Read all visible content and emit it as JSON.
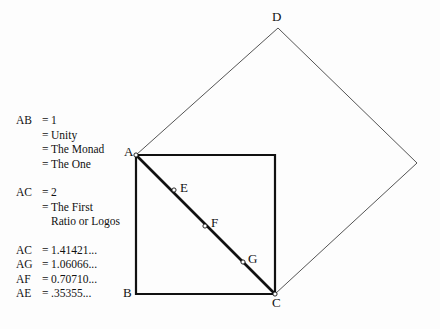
{
  "figure": {
    "background_color": "#fdfdfd",
    "line_color": "#111111",
    "thin_line_color": "#555555",
    "legend": [
      {
        "key": "AB",
        "rows": [
          {
            "eq": "=",
            "value": "1"
          },
          {
            "eq": "=",
            "value": "Unity"
          },
          {
            "eq": "=",
            "value": "The Monad"
          },
          {
            "eq": "=",
            "value": "The One"
          }
        ]
      },
      {
        "key": "AC",
        "rows": [
          {
            "eq": "=",
            "value": "2"
          },
          {
            "eq": "=",
            "value": "The First"
          },
          {
            "eq": "",
            "value": "Ratio or Logos"
          }
        ]
      },
      {
        "key": "",
        "rows": []
      }
    ],
    "measurements": [
      {
        "key": "AC",
        "eq": "=",
        "value": "1.41421..."
      },
      {
        "key": "AG",
        "eq": "=",
        "value": "1.06066..."
      },
      {
        "key": "AF",
        "eq": "=",
        "value": "0.70710..."
      },
      {
        "key": "AE",
        "eq": "=",
        "value": ".35355..."
      }
    ],
    "points": [
      {
        "name": "A",
        "label": "A",
        "x": 136,
        "y": 155,
        "label_x": 124,
        "label_y": 145
      },
      {
        "name": "B",
        "label": "B",
        "x": 136,
        "y": 294,
        "label_x": 123,
        "label_y": 286
      },
      {
        "name": "C",
        "label": "C",
        "x": 275,
        "y": 294,
        "label_x": 272,
        "label_y": 296
      },
      {
        "name": "D",
        "label": "D",
        "x": 278,
        "y": 28,
        "label_x": 272,
        "label_y": 10
      },
      {
        "name": "E",
        "label": "E",
        "x": 174,
        "y": 190,
        "label_x": 180,
        "label_y": 181
      },
      {
        "name": "F",
        "label": "F",
        "x": 205,
        "y": 226,
        "label_x": 211,
        "label_y": 216
      },
      {
        "name": "G",
        "label": "G",
        "x": 243,
        "y": 262,
        "label_x": 248,
        "label_y": 252
      }
    ],
    "shapes": {
      "square_points": "136,155 275,155 275,294 136,294",
      "diamond_points": "136,155 278,28 417,163 275,294",
      "diagonal": {
        "x1": 136,
        "y1": 155,
        "x2": 275,
        "y2": 294
      }
    }
  }
}
